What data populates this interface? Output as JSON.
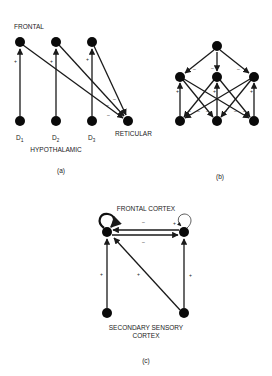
{
  "panels": {
    "a": {
      "caption": "(a)",
      "top_label": "FRONTAL",
      "bottom_label": "HYPOTHALAMIC",
      "target_label": "RETICULAR",
      "d_labels": [
        {
          "main": "D",
          "sub": "1"
        },
        {
          "main": "D",
          "sub": "2"
        },
        {
          "main": "D",
          "sub": "3"
        }
      ],
      "signs": {
        "excitatory": "+",
        "inhibitory": "–"
      }
    },
    "b": {
      "caption": "(b)",
      "signs": {
        "excitatory": "+",
        "inhibitory": "–"
      }
    },
    "c": {
      "caption": "(c)",
      "top_label": "FRONTAL CORTEX",
      "bottom_label_line1": "SECONDARY SENSORY",
      "bottom_label_line2": "CORTEX",
      "signs": {
        "excitatory": "+",
        "inhibitory": "–"
      }
    }
  }
}
